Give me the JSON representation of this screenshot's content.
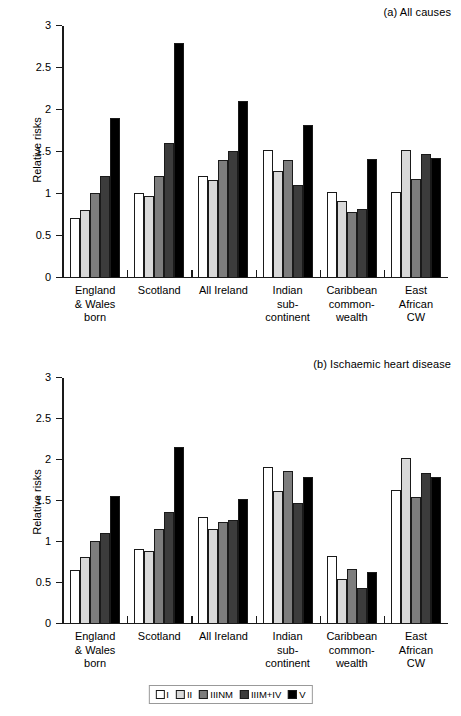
{
  "figure": {
    "y_axis_title": "Relative risks"
  },
  "legend": {
    "position": "bottom-center",
    "entries": [
      {
        "label": "I",
        "color": "#ffffff"
      },
      {
        "label": "II",
        "color": "#d9d9d9"
      },
      {
        "label": "IIINM",
        "color": "#7d7d7d"
      },
      {
        "label": "IIIM+IV",
        "color": "#3c3c3c"
      },
      {
        "label": "V",
        "color": "#000000"
      }
    ]
  },
  "chart_data": [
    {
      "type": "bar",
      "panel": "a",
      "title": "(a) All causes",
      "xlabel": "",
      "ylabel": "Relative risks",
      "ylim": [
        0,
        3
      ],
      "yticks": [
        0,
        0.5,
        1,
        1.5,
        2,
        2.5,
        3
      ],
      "ytick_labels": [
        "0",
        "0.5",
        "1",
        "1.5",
        "2",
        "2.5",
        "3"
      ],
      "grid": false,
      "legend_position": "bottom-center",
      "categories": [
        [
          "England",
          "& Wales",
          "born"
        ],
        [
          "Scotland"
        ],
        [
          "All Ireland"
        ],
        [
          "Indian",
          "sub-",
          "continent"
        ],
        [
          "Caribbean",
          "common-",
          "wealth"
        ],
        [
          "East",
          "African",
          "CW"
        ]
      ],
      "series": [
        {
          "name": "I",
          "color": "#ffffff",
          "values": [
            0.7,
            1.0,
            1.2,
            1.51,
            1.01,
            1.01
          ]
        },
        {
          "name": "II",
          "color": "#d9d9d9",
          "values": [
            0.8,
            0.96,
            1.15,
            1.26,
            0.91,
            1.52
          ]
        },
        {
          "name": "IIINM",
          "color": "#7d7d7d",
          "values": [
            1.0,
            1.2,
            1.4,
            1.4,
            0.77,
            1.17
          ]
        },
        {
          "name": "IIIM+IV",
          "color": "#3c3c3c",
          "values": [
            1.2,
            1.6,
            1.5,
            1.1,
            0.81,
            1.47
          ]
        },
        {
          "name": "V",
          "color": "#000000",
          "values": [
            1.9,
            2.8,
            2.1,
            1.81,
            1.41,
            1.42
          ]
        }
      ]
    },
    {
      "type": "bar",
      "panel": "b",
      "title": "(b) Ischaemic heart disease",
      "xlabel": "",
      "ylabel": "Relative risks",
      "ylim": [
        0,
        3
      ],
      "yticks": [
        0,
        0.5,
        1,
        1.5,
        2,
        2.5,
        3
      ],
      "ytick_labels": [
        "0",
        "0.5",
        "1",
        "1.5",
        "2",
        "2.5",
        "3"
      ],
      "grid": false,
      "legend_position": "bottom-center",
      "categories": [
        [
          "England",
          "& Wales",
          "born"
        ],
        [
          "Scotland"
        ],
        [
          "All Ireland"
        ],
        [
          "Indian",
          "sub-",
          "continent"
        ],
        [
          "Caribbean",
          "common-",
          "wealth"
        ],
        [
          "East",
          "African",
          "CW"
        ]
      ],
      "series": [
        {
          "name": "I",
          "color": "#ffffff",
          "values": [
            0.65,
            0.9,
            1.3,
            1.91,
            0.82,
            1.62
          ]
        },
        {
          "name": "II",
          "color": "#d9d9d9",
          "values": [
            0.8,
            0.88,
            1.15,
            1.61,
            0.54,
            2.02
          ]
        },
        {
          "name": "IIINM",
          "color": "#7d7d7d",
          "values": [
            1.0,
            1.15,
            1.23,
            1.86,
            0.66,
            1.54
          ]
        },
        {
          "name": "IIIM+IV",
          "color": "#3c3c3c",
          "values": [
            1.1,
            1.35,
            1.26,
            1.47,
            0.42,
            1.84
          ]
        },
        {
          "name": "V",
          "color": "#000000",
          "values": [
            1.55,
            2.15,
            1.51,
            1.79,
            0.62,
            1.78
          ]
        }
      ]
    }
  ]
}
